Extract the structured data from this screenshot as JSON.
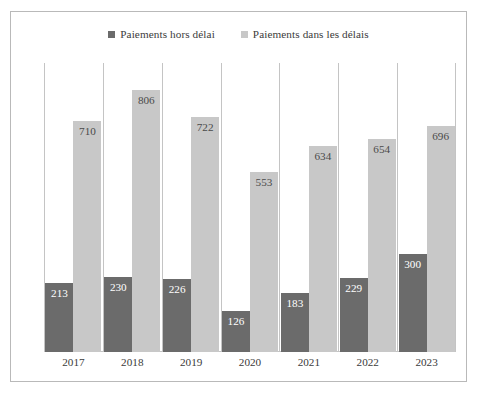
{
  "chart_data": {
    "type": "bar",
    "title": "",
    "subtitle": "",
    "xlabel": "",
    "ylabel": "",
    "categories": [
      "2017",
      "2018",
      "2019",
      "2020",
      "2021",
      "2022",
      "2023"
    ],
    "series": [
      {
        "name": "Paiements hors délai",
        "color": "#6b6b6b",
        "values": [
          213,
          230,
          226,
          126,
          183,
          229,
          300
        ]
      },
      {
        "name": "Paiements dans les délais",
        "color": "#c8c8c8",
        "values": [
          710,
          806,
          722,
          553,
          634,
          654,
          696
        ]
      }
    ],
    "ylim": [
      0,
      806
    ],
    "grid": "vertical-category-separators",
    "legend_position": "top-center",
    "data_labels": true,
    "axis_tick_labels_visible": false
  },
  "legend": {
    "entries": [
      {
        "label": "Paiements hors délai",
        "color": "#6b6b6b"
      },
      {
        "label": "Paiements dans les délais",
        "color": "#c8c8c8"
      }
    ]
  },
  "frame": {
    "border_color": "#b9b9b9",
    "gridline_color": "#c4c4c4",
    "background": "#ffffff"
  }
}
